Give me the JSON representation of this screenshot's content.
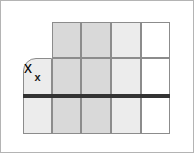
{
  "figure": {
    "type": "grid-diagram",
    "width": 194,
    "height": 153,
    "background_color": "#ffffff",
    "frame_color": "#b4b4b4"
  },
  "grid": {
    "columns": 5,
    "rows": 3,
    "line_color": "#8c8c8c",
    "shade_dark_color": "#d9d9d9",
    "shade_light_color": "#ececec",
    "empty_color": "#ffffff",
    "column_x": [
      22,
      51,
      80,
      110,
      140,
      169
    ],
    "row_y": [
      21,
      57,
      96,
      133
    ],
    "cells": [
      {
        "name": "cell-r1c2",
        "col": 2,
        "row": 1,
        "x": 51,
        "y": 21,
        "w": 29,
        "h": 36,
        "shade": "dark",
        "rounded": false,
        "label": ""
      },
      {
        "name": "cell-r1c3",
        "col": 3,
        "row": 1,
        "x": 80,
        "y": 21,
        "w": 30,
        "h": 36,
        "shade": "dark",
        "rounded": false,
        "label": ""
      },
      {
        "name": "cell-r1c4",
        "col": 4,
        "row": 1,
        "x": 110,
        "y": 21,
        "w": 30,
        "h": 36,
        "shade": "light",
        "rounded": false,
        "label": ""
      },
      {
        "name": "cell-r1c5",
        "col": 5,
        "row": 1,
        "x": 140,
        "y": 21,
        "w": 29,
        "h": 36,
        "shade": "none",
        "rounded": false,
        "label": ""
      },
      {
        "name": "cell-r2c1",
        "col": 1,
        "row": 2,
        "x": 22,
        "y": 57,
        "w": 29,
        "h": 39,
        "shade": "light",
        "rounded": true,
        "label": "x"
      },
      {
        "name": "cell-r2c2",
        "col": 2,
        "row": 2,
        "x": 51,
        "y": 57,
        "w": 29,
        "h": 39,
        "shade": "dark",
        "rounded": false,
        "label": ""
      },
      {
        "name": "cell-r2c3",
        "col": 3,
        "row": 2,
        "x": 80,
        "y": 57,
        "w": 30,
        "h": 39,
        "shade": "dark",
        "rounded": false,
        "label": ""
      },
      {
        "name": "cell-r2c4",
        "col": 4,
        "row": 2,
        "x": 110,
        "y": 57,
        "w": 30,
        "h": 39,
        "shade": "light",
        "rounded": false,
        "label": ""
      },
      {
        "name": "cell-r2c5",
        "col": 5,
        "row": 2,
        "x": 140,
        "y": 57,
        "w": 29,
        "h": 39,
        "shade": "none",
        "rounded": false,
        "label": ""
      },
      {
        "name": "cell-r3c1",
        "col": 1,
        "row": 3,
        "x": 22,
        "y": 96,
        "w": 29,
        "h": 37,
        "shade": "light",
        "rounded": false,
        "label": ""
      },
      {
        "name": "cell-r3c2",
        "col": 2,
        "row": 3,
        "x": 51,
        "y": 96,
        "w": 29,
        "h": 37,
        "shade": "dark",
        "rounded": false,
        "label": ""
      },
      {
        "name": "cell-r3c3",
        "col": 3,
        "row": 3,
        "x": 80,
        "y": 96,
        "w": 30,
        "h": 37,
        "shade": "dark",
        "rounded": false,
        "label": ""
      },
      {
        "name": "cell-r3c4",
        "col": 4,
        "row": 3,
        "x": 110,
        "y": 96,
        "w": 30,
        "h": 37,
        "shade": "light",
        "rounded": false,
        "label": ""
      },
      {
        "name": "cell-r3c5",
        "col": 5,
        "row": 3,
        "x": 140,
        "y": 96,
        "w": 29,
        "h": 37,
        "shade": "none",
        "rounded": false,
        "label": ""
      }
    ]
  },
  "markers": {
    "x_marker": {
      "label": "x",
      "x": 22,
      "y": 57,
      "w": 29,
      "h": 39,
      "color": "#1a1a1a"
    }
  },
  "separator": {
    "name": "horizontal-rule",
    "color": "#333333",
    "x": 22,
    "y": 93,
    "w": 147,
    "h": 4
  }
}
